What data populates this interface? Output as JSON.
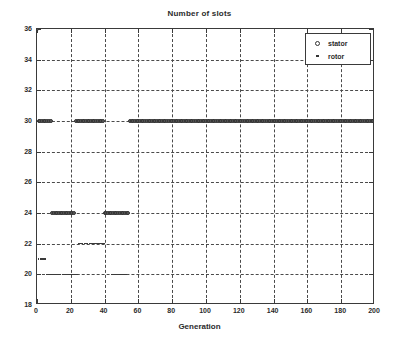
{
  "chart_data": {
    "type": "scatter",
    "title": "Number of slots",
    "xlabel": "Generation",
    "ylabel": "",
    "xlim": [
      0,
      200
    ],
    "ylim": [
      18,
      36
    ],
    "xticks": [
      0,
      20,
      40,
      60,
      80,
      100,
      120,
      140,
      160,
      180,
      200
    ],
    "yticks": [
      18,
      20,
      22,
      24,
      26,
      28,
      30,
      32,
      34,
      36
    ],
    "grid": true,
    "legend_position": "top-right",
    "series": [
      {
        "name": "stator",
        "marker": "circle",
        "color": "#5e5e5e",
        "points": [
          [
            0,
            36
          ],
          [
            1,
            30
          ],
          [
            2,
            30
          ],
          [
            3,
            30
          ],
          [
            4,
            30
          ],
          [
            5,
            30
          ],
          [
            6,
            30
          ],
          [
            7,
            30
          ],
          [
            8,
            30
          ],
          [
            9,
            24
          ],
          [
            10,
            24
          ],
          [
            11,
            24
          ],
          [
            12,
            24
          ],
          [
            13,
            24
          ],
          [
            14,
            24
          ],
          [
            15,
            24
          ],
          [
            16,
            24
          ],
          [
            17,
            24
          ],
          [
            18,
            24
          ],
          [
            19,
            24
          ],
          [
            20,
            24
          ],
          [
            21,
            24
          ],
          [
            22,
            24
          ],
          [
            23,
            30
          ],
          [
            24,
            30
          ],
          [
            25,
            30
          ],
          [
            26,
            30
          ],
          [
            27,
            30
          ],
          [
            28,
            30
          ],
          [
            29,
            30
          ],
          [
            30,
            30
          ],
          [
            31,
            30
          ],
          [
            32,
            30
          ],
          [
            33,
            30
          ],
          [
            34,
            30
          ],
          [
            35,
            30
          ],
          [
            36,
            30
          ],
          [
            37,
            30
          ],
          [
            38,
            30
          ],
          [
            39,
            30
          ],
          [
            40,
            24
          ],
          [
            41,
            24
          ],
          [
            42,
            24
          ],
          [
            43,
            24
          ],
          [
            44,
            24
          ],
          [
            45,
            24
          ],
          [
            46,
            24
          ],
          [
            47,
            24
          ],
          [
            48,
            24
          ],
          [
            49,
            24
          ],
          [
            50,
            24
          ],
          [
            51,
            24
          ],
          [
            52,
            24
          ],
          [
            53,
            24
          ],
          [
            54,
            24
          ],
          [
            55,
            30
          ],
          [
            56,
            30
          ],
          [
            57,
            30
          ],
          [
            58,
            30
          ],
          [
            59,
            30
          ],
          [
            60,
            30
          ],
          [
            61,
            30
          ],
          [
            62,
            30
          ],
          [
            63,
            30
          ],
          [
            64,
            30
          ],
          [
            65,
            30
          ],
          [
            66,
            30
          ],
          [
            67,
            30
          ],
          [
            68,
            30
          ],
          [
            69,
            30
          ],
          [
            70,
            30
          ],
          [
            71,
            30
          ],
          [
            72,
            30
          ],
          [
            73,
            30
          ],
          [
            74,
            30
          ],
          [
            75,
            30
          ],
          [
            76,
            30
          ],
          [
            77,
            30
          ],
          [
            78,
            30
          ],
          [
            79,
            30
          ],
          [
            80,
            30
          ],
          [
            81,
            30
          ],
          [
            82,
            30
          ],
          [
            83,
            30
          ],
          [
            84,
            30
          ],
          [
            85,
            30
          ],
          [
            86,
            30
          ],
          [
            87,
            30
          ],
          [
            88,
            30
          ],
          [
            89,
            30
          ],
          [
            90,
            30
          ],
          [
            91,
            30
          ],
          [
            92,
            30
          ],
          [
            93,
            30
          ],
          [
            94,
            30
          ],
          [
            95,
            30
          ],
          [
            96,
            30
          ],
          [
            97,
            30
          ],
          [
            98,
            30
          ],
          [
            99,
            30
          ],
          [
            100,
            30
          ],
          [
            101,
            30
          ],
          [
            102,
            30
          ],
          [
            103,
            30
          ],
          [
            104,
            30
          ],
          [
            105,
            30
          ],
          [
            106,
            30
          ],
          [
            107,
            30
          ],
          [
            108,
            30
          ],
          [
            109,
            30
          ],
          [
            110,
            30
          ],
          [
            111,
            30
          ],
          [
            112,
            30
          ],
          [
            113,
            30
          ],
          [
            114,
            30
          ],
          [
            115,
            30
          ],
          [
            116,
            30
          ],
          [
            117,
            30
          ],
          [
            118,
            30
          ],
          [
            119,
            30
          ],
          [
            120,
            30
          ],
          [
            121,
            30
          ],
          [
            122,
            30
          ],
          [
            123,
            30
          ],
          [
            124,
            30
          ],
          [
            125,
            30
          ],
          [
            126,
            30
          ],
          [
            127,
            30
          ],
          [
            128,
            30
          ],
          [
            129,
            30
          ],
          [
            130,
            30
          ],
          [
            131,
            30
          ],
          [
            132,
            30
          ],
          [
            133,
            30
          ],
          [
            134,
            30
          ],
          [
            135,
            30
          ],
          [
            136,
            30
          ],
          [
            137,
            30
          ],
          [
            138,
            30
          ],
          [
            139,
            30
          ],
          [
            140,
            30
          ],
          [
            141,
            30
          ],
          [
            142,
            30
          ],
          [
            143,
            30
          ],
          [
            144,
            30
          ],
          [
            145,
            30
          ],
          [
            146,
            30
          ],
          [
            147,
            30
          ],
          [
            148,
            30
          ],
          [
            149,
            30
          ],
          [
            150,
            30
          ],
          [
            151,
            30
          ],
          [
            152,
            30
          ],
          [
            153,
            30
          ],
          [
            154,
            30
          ],
          [
            155,
            30
          ],
          [
            156,
            30
          ],
          [
            157,
            30
          ],
          [
            158,
            30
          ],
          [
            159,
            30
          ],
          [
            160,
            30
          ],
          [
            161,
            30
          ],
          [
            162,
            30
          ],
          [
            163,
            30
          ],
          [
            164,
            30
          ],
          [
            165,
            30
          ],
          [
            166,
            30
          ],
          [
            167,
            30
          ],
          [
            168,
            30
          ],
          [
            169,
            30
          ],
          [
            170,
            30
          ],
          [
            171,
            30
          ],
          [
            172,
            30
          ],
          [
            173,
            30
          ],
          [
            174,
            30
          ],
          [
            175,
            30
          ],
          [
            176,
            30
          ],
          [
            177,
            30
          ],
          [
            178,
            30
          ],
          [
            179,
            30
          ],
          [
            180,
            30
          ],
          [
            181,
            30
          ],
          [
            182,
            30
          ],
          [
            183,
            30
          ],
          [
            184,
            30
          ],
          [
            185,
            30
          ],
          [
            186,
            30
          ],
          [
            187,
            30
          ],
          [
            188,
            30
          ],
          [
            189,
            30
          ],
          [
            190,
            30
          ],
          [
            191,
            30
          ],
          [
            192,
            30
          ],
          [
            193,
            30
          ],
          [
            194,
            30
          ],
          [
            195,
            30
          ],
          [
            196,
            30
          ],
          [
            197,
            30
          ],
          [
            198,
            30
          ],
          [
            199,
            30
          ],
          [
            200,
            30
          ]
        ]
      },
      {
        "name": "rotor",
        "marker": "dot",
        "color": "#3a3a3a",
        "points": [
          [
            1,
            21
          ],
          [
            2,
            21
          ],
          [
            3,
            21
          ],
          [
            4,
            21
          ],
          [
            5,
            21
          ],
          [
            6,
            20
          ],
          [
            7,
            20
          ],
          [
            8,
            20
          ],
          [
            9,
            20
          ],
          [
            10,
            20
          ],
          [
            11,
            20
          ],
          [
            12,
            20
          ],
          [
            13,
            20
          ],
          [
            14,
            20
          ],
          [
            15,
            20
          ],
          [
            16,
            20
          ],
          [
            17,
            20
          ],
          [
            18,
            20
          ],
          [
            19,
            20
          ],
          [
            20,
            20
          ],
          [
            21,
            20
          ],
          [
            22,
            20
          ],
          [
            23,
            20
          ],
          [
            24,
            20
          ],
          [
            25,
            22
          ],
          [
            26,
            22
          ],
          [
            27,
            22
          ],
          [
            28,
            22
          ],
          [
            29,
            22
          ],
          [
            30,
            22
          ],
          [
            31,
            22
          ],
          [
            32,
            22
          ],
          [
            33,
            22
          ],
          [
            34,
            22
          ],
          [
            35,
            22
          ],
          [
            36,
            22
          ],
          [
            37,
            22
          ],
          [
            38,
            22
          ],
          [
            39,
            22
          ],
          [
            40,
            22
          ],
          [
            44,
            20
          ],
          [
            45,
            20
          ],
          [
            46,
            20
          ],
          [
            47,
            20
          ],
          [
            48,
            20
          ],
          [
            49,
            20
          ],
          [
            50,
            20
          ],
          [
            51,
            20
          ],
          [
            52,
            20
          ],
          [
            53,
            20
          ],
          [
            56,
            18
          ],
          [
            58,
            18
          ],
          [
            60,
            18
          ],
          [
            62,
            18
          ],
          [
            64,
            18
          ],
          [
            66,
            18
          ],
          [
            68,
            18
          ],
          [
            70,
            18
          ],
          [
            72,
            18
          ],
          [
            74,
            18
          ],
          [
            76,
            18
          ],
          [
            78,
            18
          ],
          [
            80,
            18
          ],
          [
            82,
            18
          ],
          [
            84,
            18
          ],
          [
            86,
            18
          ],
          [
            88,
            18
          ],
          [
            90,
            18
          ],
          [
            92,
            18
          ],
          [
            94,
            18
          ],
          [
            96,
            18
          ],
          [
            98,
            18
          ],
          [
            100,
            18
          ],
          [
            102,
            18
          ],
          [
            104,
            18
          ],
          [
            106,
            18
          ],
          [
            108,
            18
          ],
          [
            110,
            18
          ],
          [
            112,
            18
          ],
          [
            114,
            18
          ],
          [
            116,
            18
          ],
          [
            118,
            18
          ],
          [
            120,
            18
          ],
          [
            122,
            18
          ],
          [
            124,
            18
          ],
          [
            126,
            18
          ],
          [
            128,
            18
          ],
          [
            130,
            18
          ],
          [
            132,
            18
          ],
          [
            134,
            18
          ],
          [
            136,
            18
          ],
          [
            138,
            18
          ],
          [
            140,
            18
          ],
          [
            142,
            18
          ],
          [
            144,
            18
          ],
          [
            146,
            18
          ],
          [
            148,
            18
          ],
          [
            150,
            18
          ],
          [
            152,
            18
          ],
          [
            154,
            18
          ],
          [
            156,
            18
          ],
          [
            158,
            18
          ],
          [
            160,
            18
          ],
          [
            162,
            18
          ],
          [
            164,
            18
          ],
          [
            166,
            18
          ],
          [
            168,
            18
          ],
          [
            170,
            18
          ],
          [
            172,
            18
          ],
          [
            174,
            18
          ],
          [
            176,
            18
          ],
          [
            178,
            18
          ],
          [
            180,
            18
          ],
          [
            182,
            18
          ],
          [
            184,
            18
          ],
          [
            186,
            18
          ],
          [
            188,
            18
          ],
          [
            190,
            18
          ],
          [
            192,
            18
          ],
          [
            194,
            18
          ],
          [
            196,
            18
          ],
          [
            198,
            18
          ],
          [
            200,
            18
          ]
        ]
      }
    ]
  },
  "legend": {
    "entries": [
      {
        "label": "stator",
        "marker": "circle"
      },
      {
        "label": "rotor",
        "marker": "dot"
      }
    ]
  }
}
